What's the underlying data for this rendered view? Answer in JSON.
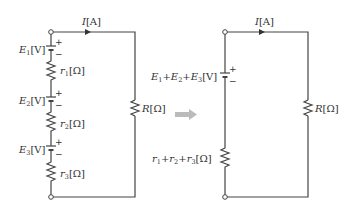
{
  "diagram": {
    "left_circuit": {
      "current_label": {
        "sym": "I",
        "unit": "[A]"
      },
      "batteries": [
        {
          "sym": "E",
          "sub": "1",
          "unit": "[V]",
          "plus": "+",
          "minus": "−"
        },
        {
          "sym": "E",
          "sub": "2",
          "unit": "[V]",
          "plus": "+",
          "minus": "−"
        },
        {
          "sym": "E",
          "sub": "3",
          "unit": "[V]",
          "plus": "+",
          "minus": "−"
        }
      ],
      "internal_resistors": [
        {
          "sym": "r",
          "sub": "1",
          "unit": "[Ω]"
        },
        {
          "sym": "r",
          "sub": "2",
          "unit": "[Ω]"
        },
        {
          "sym": "r",
          "sub": "3",
          "unit": "[Ω]"
        }
      ],
      "load": {
        "sym": "R",
        "unit": "[Ω]"
      }
    },
    "arrow": {
      "meaning": "equivalent-to",
      "color": "#bbbbbb"
    },
    "right_circuit": {
      "current_label": {
        "sym": "I",
        "unit": "[A]"
      },
      "battery": {
        "parts": [
          "E",
          "1",
          "+",
          "E",
          "2",
          "+",
          "E",
          "3"
        ],
        "unit": "[V]",
        "plus": "+",
        "minus": "−"
      },
      "internal_resistor": {
        "parts": [
          "r",
          "1",
          "+",
          "r",
          "2",
          "+",
          "r",
          "3"
        ],
        "unit": "[Ω]"
      },
      "load": {
        "sym": "R",
        "unit": "[Ω]"
      }
    }
  }
}
